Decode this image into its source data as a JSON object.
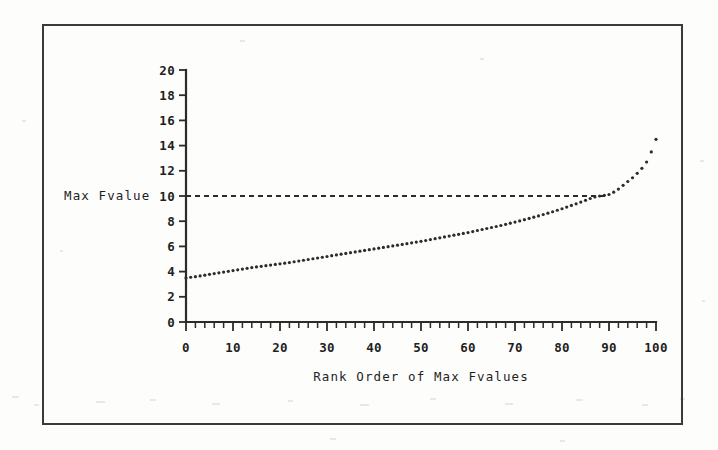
{
  "figure": {
    "frame_color": "#3a3a3a",
    "background_color": "#fdfdfc",
    "ink_color": "#2b2b2b"
  },
  "chart_data": {
    "type": "scatter",
    "title": "",
    "subtitle": "",
    "xlabel": "Rank Order of Max Fvalues",
    "ylabel": "Max Fvalue",
    "xlim": [
      0,
      100
    ],
    "ylim": [
      0,
      20
    ],
    "grid": false,
    "legend": null,
    "legend_position": "none",
    "x_ticks": [
      0,
      10,
      20,
      30,
      40,
      50,
      60,
      70,
      80,
      90,
      100
    ],
    "x_tick_labels": [
      "0",
      "10",
      "20",
      "30",
      "40",
      "50",
      "60",
      "70",
      "80",
      "90",
      "100"
    ],
    "x_minor_tick_step": 2,
    "y_ticks": [
      0,
      2,
      4,
      6,
      8,
      10,
      12,
      14,
      16,
      18,
      20
    ],
    "y_tick_labels": [
      "0",
      "2",
      "4",
      "6",
      "8",
      "10",
      "12",
      "14",
      "16",
      "18",
      "20"
    ],
    "annotations": [
      {
        "name": "critical-value-reference-line",
        "type": "horizontal-dashed-line",
        "y": 10,
        "x_start": 0,
        "x_end": 90,
        "style": "dashed"
      }
    ],
    "marker": "dot",
    "marker_size": 1.6,
    "x": [
      0,
      1,
      2,
      3,
      4,
      5,
      6,
      7,
      8,
      9,
      10,
      11,
      12,
      13,
      14,
      15,
      16,
      17,
      18,
      19,
      20,
      21,
      22,
      23,
      24,
      25,
      26,
      27,
      28,
      29,
      30,
      31,
      32,
      33,
      34,
      35,
      36,
      37,
      38,
      39,
      40,
      41,
      42,
      43,
      44,
      45,
      46,
      47,
      48,
      49,
      50,
      51,
      52,
      53,
      54,
      55,
      56,
      57,
      58,
      59,
      60,
      61,
      62,
      63,
      64,
      65,
      66,
      67,
      68,
      69,
      70,
      71,
      72,
      73,
      74,
      75,
      76,
      77,
      78,
      79,
      80,
      81,
      82,
      83,
      84,
      85,
      86,
      87,
      88,
      89,
      90,
      91,
      92,
      93,
      94,
      95,
      96,
      97,
      98,
      99,
      100
    ],
    "values": [
      3.5,
      3.55,
      3.6,
      3.66,
      3.72,
      3.78,
      3.84,
      3.9,
      3.96,
      4.02,
      4.08,
      4.14,
      4.2,
      4.26,
      4.32,
      4.37,
      4.42,
      4.47,
      4.52,
      4.57,
      4.62,
      4.67,
      4.72,
      4.78,
      4.84,
      4.9,
      4.96,
      5.02,
      5.08,
      5.14,
      5.2,
      5.26,
      5.32,
      5.38,
      5.44,
      5.5,
      5.56,
      5.62,
      5.68,
      5.74,
      5.8,
      5.86,
      5.92,
      5.98,
      6.04,
      6.1,
      6.16,
      6.22,
      6.28,
      6.34,
      6.4,
      6.47,
      6.54,
      6.61,
      6.68,
      6.75,
      6.82,
      6.89,
      6.96,
      7.03,
      7.1,
      7.18,
      7.26,
      7.34,
      7.42,
      7.5,
      7.58,
      7.66,
      7.75,
      7.84,
      7.93,
      8.02,
      8.12,
      8.22,
      8.32,
      8.42,
      8.53,
      8.64,
      8.75,
      8.87,
      8.99,
      9.12,
      9.25,
      9.38,
      9.52,
      9.66,
      9.8,
      9.92,
      10.0,
      10.05,
      10.12,
      10.3,
      10.55,
      10.85,
      11.15,
      11.45,
      11.8,
      12.2,
      12.7,
      13.5,
      14.5
    ],
    "series_name": "Max Fvalue by rank"
  }
}
